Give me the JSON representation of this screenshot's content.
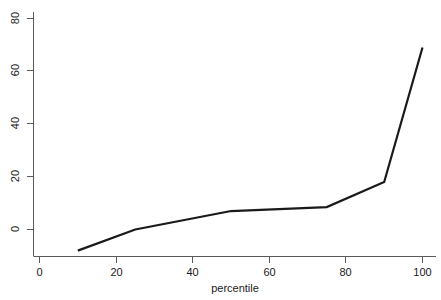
{
  "chart_data": {
    "type": "line",
    "title": "",
    "subtitle": "",
    "xlabel": "percentile",
    "ylabel": "",
    "x": [
      10,
      25,
      50,
      75,
      90,
      100
    ],
    "values": [
      -8,
      0,
      7,
      8.5,
      18,
      69
    ],
    "series": [
      {
        "name": "",
        "x": [
          10,
          25,
          50,
          75,
          90,
          100
        ],
        "values": [
          -8,
          0,
          7,
          8.5,
          18,
          69
        ]
      }
    ],
    "xlim": [
      -2,
      104
    ],
    "ylim": [
      -12,
      84
    ],
    "xticks": [
      0,
      20,
      40,
      60,
      80,
      100
    ],
    "yticks": [
      0,
      20,
      40,
      60,
      80
    ],
    "xtick_labels": [
      "0",
      "20",
      "40",
      "60",
      "80",
      "100"
    ],
    "ytick_labels": [
      "0",
      "20",
      "40",
      "60",
      "80"
    ],
    "grid": false,
    "legend": "none",
    "line_color": "#1a1a1a",
    "axis_color": "#5a5a5a",
    "background_color": "#ffffff"
  }
}
